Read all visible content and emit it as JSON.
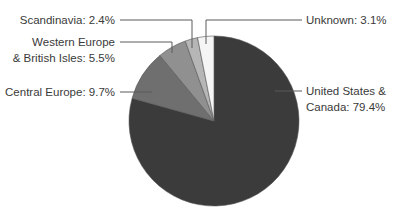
{
  "chart_data": {
    "type": "pie",
    "title": "",
    "start_angle_deg": 0,
    "direction": "clockwise",
    "slices": [
      {
        "label": "United States & Canada",
        "value": 79.4,
        "color": "#3b3b3b",
        "text_lines": [
          "United States &",
          "Canada: 79.4%"
        ]
      },
      {
        "label": "Central Europe",
        "value": 9.7,
        "color": "#6f6f6f",
        "text_lines": [
          "Central Europe: 9.7%"
        ]
      },
      {
        "label": "Western Europe & British Isles",
        "value": 5.5,
        "color": "#909090",
        "text_lines": [
          "Western Europe",
          "& British Isles: 5.5%"
        ]
      },
      {
        "label": "Scandinavia",
        "value": 2.4,
        "color": "#b6b6b6",
        "text_lines": [
          "Scandinavia: 2.4%"
        ]
      },
      {
        "label": "Unknown",
        "value": 3.1,
        "color": "#f5f5f5",
        "text_lines": [
          "Unknown: 3.1%"
        ]
      }
    ],
    "legend": "none (leader-line labels)"
  },
  "labels": {
    "us_canada_1": "United States &",
    "us_canada_2": "Canada: 79.4%",
    "central_europe": "Central Europe: 9.7%",
    "western_europe_1": "Western Europe",
    "western_europe_2": "& British Isles: 5.5%",
    "scandinavia": "Scandinavia: 2.4%",
    "unknown": "Unknown: 3.1%"
  }
}
